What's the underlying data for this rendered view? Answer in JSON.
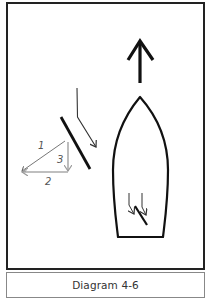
{
  "diagram": {
    "caption": "Diagram 4-6",
    "labels": {
      "vector_1": "1",
      "vector_2": "2",
      "vector_3": "3"
    },
    "elements": [
      {
        "name": "heading-arrow",
        "description": "Large arrow pointing up (direction of travel)"
      },
      {
        "name": "boat-hull",
        "description": "Boat outline viewed from above, bow pointing up"
      },
      {
        "name": "sail-line",
        "description": "Thick diagonal line representing the sail"
      },
      {
        "name": "wind-arrow",
        "description": "Thin bent arrow showing wind deflected by the sail"
      },
      {
        "name": "force-triangle",
        "description": "Vector triangle with components 1, 2, 3"
      },
      {
        "name": "boat-sail-symbol",
        "description": "Small sail and wind arrows inside the boat"
      }
    ],
    "colors": {
      "frame": "#222222",
      "stroke": "#1a1a1a",
      "vector_gray": "#999999",
      "caption_border": "#888888",
      "caption_text": "#333333"
    }
  }
}
